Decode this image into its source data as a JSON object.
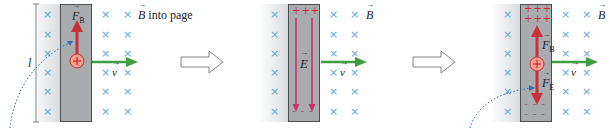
{
  "figure": {
    "panels": [
      {
        "id": "panel-1",
        "labels": {
          "force": "F",
          "force_sub": "B",
          "velocity": "v",
          "field": "B",
          "field_desc": " into page",
          "length": "l",
          "charge": "+"
        }
      },
      {
        "id": "panel-2",
        "labels": {
          "efield": "E",
          "velocity": "v",
          "field": "B",
          "top_charges": "+++",
          "bottom_charges": "– – –"
        }
      },
      {
        "id": "panel-3",
        "labels": {
          "force_b": "F",
          "force_b_sub": "B",
          "force_e": "F",
          "force_e_sub": "E",
          "velocity": "v",
          "field": "B",
          "charge": "+",
          "top_charges_row1": "+++",
          "top_charges_row2": "+++",
          "bottom_charges_row1": "– – –",
          "bottom_charges_row2": "– – –"
        }
      }
    ],
    "colors": {
      "rod": "#a9acae",
      "force_arrow": "#c8303c",
      "efield_arrow": "#d0306a",
      "velocity_arrow": "#3f9e3f",
      "field_cross": "#5fa8d6",
      "trajectory": "#2d6fb5",
      "charge_fill": "#f4a08a"
    },
    "cross_symbol": "×"
  }
}
